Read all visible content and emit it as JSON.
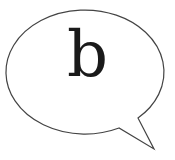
{
  "bubble": {
    "text": "b",
    "stroke_color": "#444444",
    "fill_color": "#ffffff"
  }
}
